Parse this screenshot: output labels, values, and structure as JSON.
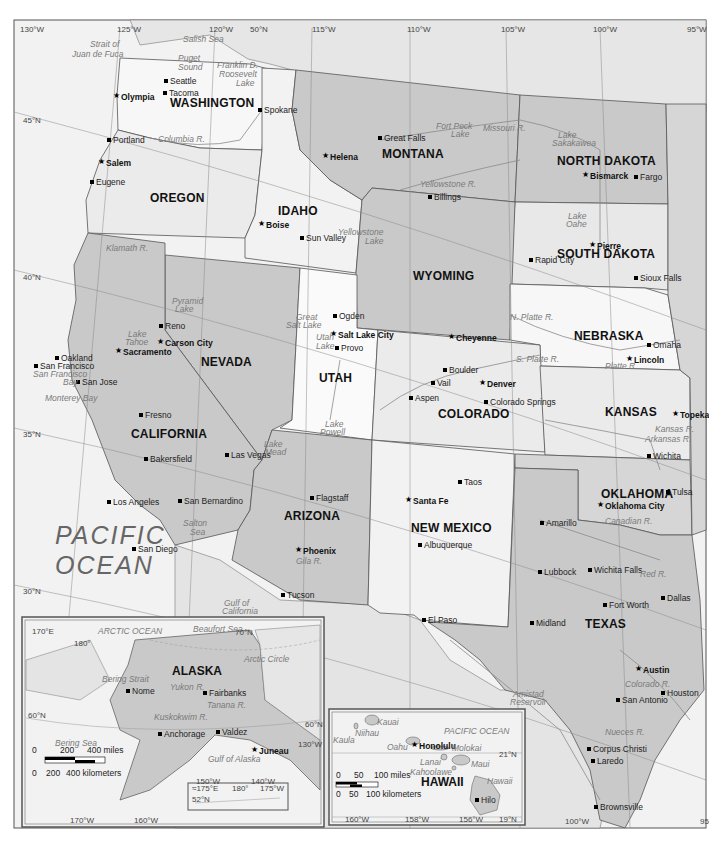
{
  "map": {
    "ocean_label_line1": "PACIFIC",
    "ocean_label_line2": "OCEAN",
    "states": [
      {
        "name": "WASHINGTON",
        "x": 170,
        "y": 97
      },
      {
        "name": "OREGON",
        "x": 150,
        "y": 192
      },
      {
        "name": "IDAHO",
        "x": 278,
        "y": 205
      },
      {
        "name": "MONTANA",
        "x": 382,
        "y": 148
      },
      {
        "name": "NORTH DAKOTA",
        "x": 557,
        "y": 155
      },
      {
        "name": "SOUTH DAKOTA",
        "x": 557,
        "y": 248
      },
      {
        "name": "WYOMING",
        "x": 413,
        "y": 270
      },
      {
        "name": "NEBRASKA",
        "x": 574,
        "y": 330
      },
      {
        "name": "NEVADA",
        "x": 201,
        "y": 356
      },
      {
        "name": "UTAH",
        "x": 319,
        "y": 372
      },
      {
        "name": "CALIFORNIA",
        "x": 131,
        "y": 428
      },
      {
        "name": "COLORADO",
        "x": 438,
        "y": 408
      },
      {
        "name": "KANSAS",
        "x": 605,
        "y": 406
      },
      {
        "name": "ARIZONA",
        "x": 284,
        "y": 510
      },
      {
        "name": "NEW MEXICO",
        "x": 411,
        "y": 522
      },
      {
        "name": "OKLAHOMA",
        "x": 601,
        "y": 488
      },
      {
        "name": "TEXAS",
        "x": 585,
        "y": 618
      }
    ],
    "cities": [
      {
        "name": "Seattle",
        "x": 170,
        "y": 77,
        "type": "city"
      },
      {
        "name": "Tacoma",
        "x": 169,
        "y": 89,
        "type": "city"
      },
      {
        "name": "Olympia",
        "x": 121,
        "y": 93,
        "type": "capital"
      },
      {
        "name": "Spokane",
        "x": 264,
        "y": 106,
        "type": "city"
      },
      {
        "name": "Portland",
        "x": 113,
        "y": 136,
        "type": "city"
      },
      {
        "name": "Salem",
        "x": 106,
        "y": 159,
        "type": "capital"
      },
      {
        "name": "Eugene",
        "x": 96,
        "y": 178,
        "type": "city"
      },
      {
        "name": "Helena",
        "x": 330,
        "y": 153,
        "type": "capital"
      },
      {
        "name": "Great Falls",
        "x": 384,
        "y": 134,
        "type": "city"
      },
      {
        "name": "Billings",
        "x": 434,
        "y": 193,
        "type": "city"
      },
      {
        "name": "Bismarck",
        "x": 590,
        "y": 172,
        "type": "capital"
      },
      {
        "name": "Fargo",
        "x": 640,
        "y": 173,
        "type": "city"
      },
      {
        "name": "Boise",
        "x": 266,
        "y": 221,
        "type": "capital"
      },
      {
        "name": "Sun Valley",
        "x": 306,
        "y": 234,
        "type": "city"
      },
      {
        "name": "Pierre",
        "x": 597,
        "y": 242,
        "type": "capital"
      },
      {
        "name": "Rapid City",
        "x": 535,
        "y": 256,
        "type": "city",
        "line2": "City"
      },
      {
        "name": "Sioux Falls",
        "x": 640,
        "y": 274,
        "type": "city"
      },
      {
        "name": "Ogden",
        "x": 339,
        "y": 312,
        "type": "city"
      },
      {
        "name": "Salt Lake City",
        "x": 338,
        "y": 331,
        "type": "capital"
      },
      {
        "name": "Provo",
        "x": 341,
        "y": 344,
        "type": "city"
      },
      {
        "name": "Reno",
        "x": 165,
        "y": 322,
        "type": "city"
      },
      {
        "name": "Carson City",
        "x": 165,
        "y": 339,
        "type": "capital"
      },
      {
        "name": "Sacramento",
        "x": 123,
        "y": 348,
        "type": "capital"
      },
      {
        "name": "Oakland",
        "x": 61,
        "y": 354,
        "type": "city"
      },
      {
        "name": "San Francisco",
        "x": 40,
        "y": 362,
        "type": "city"
      },
      {
        "name": "San Jose",
        "x": 82,
        "y": 378,
        "type": "city"
      },
      {
        "name": "Cheyenne",
        "x": 456,
        "y": 334,
        "type": "capital"
      },
      {
        "name": "Omaha",
        "x": 653,
        "y": 341,
        "type": "city"
      },
      {
        "name": "Lincoln",
        "x": 634,
        "y": 356,
        "type": "capital"
      },
      {
        "name": "Boulder",
        "x": 449,
        "y": 366,
        "type": "city"
      },
      {
        "name": "Denver",
        "x": 487,
        "y": 380,
        "type": "capital"
      },
      {
        "name": "Vail",
        "x": 437,
        "y": 379,
        "type": "city"
      },
      {
        "name": "Aspen",
        "x": 415,
        "y": 394,
        "type": "city"
      },
      {
        "name": "Colorado Springs",
        "x": 490,
        "y": 398,
        "type": "city"
      },
      {
        "name": "Fresno",
        "x": 145,
        "y": 411,
        "type": "city"
      },
      {
        "name": "Topeka",
        "x": 680,
        "y": 411,
        "type": "capital"
      },
      {
        "name": "Wichita",
        "x": 653,
        "y": 452,
        "type": "city"
      },
      {
        "name": "Las Vegas",
        "x": 231,
        "y": 451,
        "type": "city"
      },
      {
        "name": "Bakersfield",
        "x": 150,
        "y": 455,
        "type": "city"
      },
      {
        "name": "Taos",
        "x": 464,
        "y": 478,
        "type": "city"
      },
      {
        "name": "Santa Fe",
        "x": 413,
        "y": 497,
        "type": "capital"
      },
      {
        "name": "Tulsa",
        "x": 672,
        "y": 488,
        "type": "city"
      },
      {
        "name": "Oklahoma City",
        "x": 605,
        "y": 502,
        "type": "capital"
      },
      {
        "name": "Los Angeles",
        "x": 113,
        "y": 498,
        "type": "city"
      },
      {
        "name": "San Bernardino",
        "x": 184,
        "y": 497,
        "type": "city"
      },
      {
        "name": "Flagstaff",
        "x": 316,
        "y": 494,
        "type": "city"
      },
      {
        "name": "Amarillo",
        "x": 546,
        "y": 519,
        "type": "city"
      },
      {
        "name": "Phoenix",
        "x": 303,
        "y": 547,
        "type": "capital"
      },
      {
        "name": "Albuquerque",
        "x": 424,
        "y": 541,
        "type": "city"
      },
      {
        "name": "San Diego",
        "x": 138,
        "y": 545,
        "type": "city"
      },
      {
        "name": "Lubbock",
        "x": 544,
        "y": 568,
        "type": "city"
      },
      {
        "name": "Wichita Falls",
        "x": 594,
        "y": 566,
        "type": "city"
      },
      {
        "name": "Dallas",
        "x": 667,
        "y": 594,
        "type": "city"
      },
      {
        "name": "Fort Worth",
        "x": 609,
        "y": 601,
        "type": "city"
      },
      {
        "name": "Tucson",
        "x": 287,
        "y": 591,
        "type": "city"
      },
      {
        "name": "El Paso",
        "x": 428,
        "y": 616,
        "type": "city"
      },
      {
        "name": "Midland",
        "x": 536,
        "y": 619,
        "type": "city"
      },
      {
        "name": "Austin",
        "x": 643,
        "y": 666,
        "type": "capital"
      },
      {
        "name": "Houston",
        "x": 667,
        "y": 689,
        "type": "city"
      },
      {
        "name": "San Antonio",
        "x": 622,
        "y": 696,
        "type": "city"
      },
      {
        "name": "Corpus Christi",
        "x": 593,
        "y": 745,
        "type": "city"
      },
      {
        "name": "Laredo",
        "x": 597,
        "y": 757,
        "type": "city"
      },
      {
        "name": "Brownsville",
        "x": 600,
        "y": 803,
        "type": "city"
      }
    ],
    "water_features": [
      {
        "name": "Salish Sea",
        "x": 183,
        "y": 35
      },
      {
        "name": "Strait of",
        "x": 90,
        "y": 40
      },
      {
        "name": "Juan de Fuca",
        "x": 72,
        "y": 50
      },
      {
        "name": "Puget",
        "x": 178,
        "y": 54
      },
      {
        "name": "Sound",
        "x": 178,
        "y": 63
      },
      {
        "name": "Franklin D.",
        "x": 217,
        "y": 61
      },
      {
        "name": "Roosevelt",
        "x": 219,
        "y": 70
      },
      {
        "name": "Lake",
        "x": 236,
        "y": 79
      },
      {
        "name": "Columbia R.",
        "x": 158,
        "y": 135
      },
      {
        "name": "Fort Peck",
        "x": 436,
        "y": 122
      },
      {
        "name": "Lake",
        "x": 451,
        "y": 130
      },
      {
        "name": "Missouri R.",
        "x": 483,
        "y": 124
      },
      {
        "name": "Lake",
        "x": 558,
        "y": 131
      },
      {
        "name": "Sakakawea",
        "x": 552,
        "y": 139
      },
      {
        "name": "Yellowstone R.",
        "x": 420,
        "y": 180
      },
      {
        "name": "Klamath R.",
        "x": 106,
        "y": 244
      },
      {
        "name": "Yellowstone",
        "x": 338,
        "y": 228
      },
      {
        "name": "Lake",
        "x": 365,
        "y": 237
      },
      {
        "name": "Lake",
        "x": 568,
        "y": 212
      },
      {
        "name": "Oahe",
        "x": 566,
        "y": 220
      },
      {
        "name": "Pyramid",
        "x": 172,
        "y": 297
      },
      {
        "name": "Lake",
        "x": 175,
        "y": 305
      },
      {
        "name": "Great",
        "x": 296,
        "y": 313
      },
      {
        "name": "Salt Lake",
        "x": 286,
        "y": 321
      },
      {
        "name": "Utah",
        "x": 316,
        "y": 333
      },
      {
        "name": "Lake",
        "x": 316,
        "y": 342
      },
      {
        "name": "N. Platte R.",
        "x": 510,
        "y": 313
      },
      {
        "name": "Lake",
        "x": 128,
        "y": 330
      },
      {
        "name": "Tahoe",
        "x": 125,
        "y": 338
      },
      {
        "name": "S. Platte R.",
        "x": 516,
        "y": 355
      },
      {
        "name": "Platte R.",
        "x": 605,
        "y": 362
      },
      {
        "name": "San Francisco",
        "x": 33,
        "y": 370
      },
      {
        "name": "Bay",
        "x": 63,
        "y": 378
      },
      {
        "name": "Monterey Bay",
        "x": 45,
        "y": 394
      },
      {
        "name": "Kansas R.",
        "x": 655,
        "y": 425
      },
      {
        "name": "Arkansas R.",
        "x": 645,
        "y": 435
      },
      {
        "name": "Lake",
        "x": 325,
        "y": 420
      },
      {
        "name": "Powell",
        "x": 320,
        "y": 428
      },
      {
        "name": "Lake",
        "x": 264,
        "y": 440
      },
      {
        "name": "Mead",
        "x": 265,
        "y": 448
      },
      {
        "name": "Canadian R.",
        "x": 605,
        "y": 517
      },
      {
        "name": "Salton",
        "x": 183,
        "y": 519
      },
      {
        "name": "Sea",
        "x": 190,
        "y": 528
      },
      {
        "name": "Gila R.",
        "x": 296,
        "y": 557
      },
      {
        "name": "Red R.",
        "x": 640,
        "y": 570
      },
      {
        "name": "Gulf of",
        "x": 224,
        "y": 599
      },
      {
        "name": "California",
        "x": 222,
        "y": 607
      },
      {
        "name": "Amistad",
        "x": 513,
        "y": 690
      },
      {
        "name": "Reservoir",
        "x": 510,
        "y": 698
      },
      {
        "name": "Colorado R.",
        "x": 625,
        "y": 680
      },
      {
        "name": "Nueces R.",
        "x": 605,
        "y": 728
      }
    ],
    "grid_labels": [
      {
        "text": "130°W",
        "x": 20,
        "y": 26
      },
      {
        "text": "125°W",
        "x": 117,
        "y": 26
      },
      {
        "text": "120°W",
        "x": 209,
        "y": 26
      },
      {
        "text": "50°N",
        "x": 250,
        "y": 26
      },
      {
        "text": "115°W",
        "x": 312,
        "y": 26
      },
      {
        "text": "110°W",
        "x": 407,
        "y": 26
      },
      {
        "text": "105°W",
        "x": 501,
        "y": 26
      },
      {
        "text": "100°W",
        "x": 593,
        "y": 26
      },
      {
        "text": "95°W",
        "x": 687,
        "y": 26
      },
      {
        "text": "45°N",
        "x": 23,
        "y": 117
      },
      {
        "text": "40°N",
        "x": 23,
        "y": 274
      },
      {
        "text": "35°N",
        "x": 23,
        "y": 431
      },
      {
        "text": "30°N",
        "x": 23,
        "y": 588
      },
      {
        "text": "100°W",
        "x": 565,
        "y": 818
      },
      {
        "text": "95",
        "x": 700,
        "y": 818
      }
    ]
  },
  "alaska_inset": {
    "title": "ALASKA",
    "cities": [
      {
        "name": "Nome",
        "x": 132,
        "y": 687,
        "type": "city"
      },
      {
        "name": "Fairbanks",
        "x": 209,
        "y": 689,
        "type": "city"
      },
      {
        "name": "Anchorage",
        "x": 164,
        "y": 730,
        "type": "city"
      },
      {
        "name": "Valdez",
        "x": 222,
        "y": 728,
        "type": "city"
      },
      {
        "name": "Juneau",
        "x": 259,
        "y": 747,
        "type": "capital"
      }
    ],
    "water_features": [
      {
        "name": "ARCTIC OCEAN",
        "x": 98,
        "y": 627
      },
      {
        "name": "Beaufort Sea",
        "x": 193,
        "y": 625
      },
      {
        "name": "Arctic Circle",
        "x": 244,
        "y": 655
      },
      {
        "name": "Bering Strait",
        "x": 102,
        "y": 675
      },
      {
        "name": "Yukon R.",
        "x": 170,
        "y": 683
      },
      {
        "name": "Tanana R.",
        "x": 207,
        "y": 701
      },
      {
        "name": "Kuskokwim R.",
        "x": 154,
        "y": 713
      },
      {
        "name": "Bering Sea",
        "x": 55,
        "y": 739
      },
      {
        "name": "Gulf of Alaska",
        "x": 208,
        "y": 755
      }
    ],
    "grid_labels": [
      {
        "text": "170°E",
        "x": 32,
        "y": 628
      },
      {
        "text": "180°",
        "x": 74,
        "y": 640
      },
      {
        "text": "70°N",
        "x": 235,
        "y": 629
      },
      {
        "text": "60°N",
        "x": 28,
        "y": 712
      },
      {
        "text": "60°N",
        "x": 305,
        "y": 721
      },
      {
        "text": "130°W",
        "x": 298,
        "y": 741
      },
      {
        "text": "150°W",
        "x": 196,
        "y": 778
      },
      {
        "text": "140°W",
        "x": 251,
        "y": 778
      },
      {
        "text": "170°W",
        "x": 70,
        "y": 817
      },
      {
        "text": "160°W",
        "x": 134,
        "y": 817
      }
    ],
    "scale": {
      "miles_labels": [
        "0",
        "200",
        "400 miles"
      ],
      "km_labels": [
        "0",
        "200",
        "400 kilometers"
      ]
    },
    "aleutian_inset": {
      "labels": [
        "≈175°E",
        "180°",
        "175°W",
        "52°N"
      ]
    }
  },
  "hawaii_inset": {
    "title": "HAWAII",
    "ocean_label": "PACIFIC OCEAN",
    "cities": [
      {
        "name": "Honolulu",
        "x": 419,
        "y": 742,
        "type": "capital"
      },
      {
        "name": "Hilo",
        "x": 481,
        "y": 796,
        "type": "city"
      }
    ],
    "islands": [
      {
        "name": "Kauai",
        "x": 377,
        "y": 718
      },
      {
        "name": "Niihau",
        "x": 355,
        "y": 729
      },
      {
        "name": "Kaula",
        "x": 333,
        "y": 736
      },
      {
        "name": "Oahu",
        "x": 387,
        "y": 743
      },
      {
        "name": "Molokai",
        "x": 452,
        "y": 744
      },
      {
        "name": "Lanai",
        "x": 420,
        "y": 758
      },
      {
        "name": "Maui",
        "x": 471,
        "y": 760
      },
      {
        "name": "Kahoolawe",
        "x": 410,
        "y": 768
      },
      {
        "name": "Hawaii",
        "x": 487,
        "y": 777
      }
    ],
    "grid_labels": [
      {
        "text": "21°N",
        "x": 499,
        "y": 751
      },
      {
        "text": "19°N",
        "x": 499,
        "y": 816
      },
      {
        "text": "160°W",
        "x": 345,
        "y": 816
      },
      {
        "text": "158°W",
        "x": 405,
        "y": 816
      },
      {
        "text": "156°W",
        "x": 459,
        "y": 816
      }
    ],
    "scale": {
      "miles_labels": [
        "0",
        "50",
        "100 miles"
      ],
      "km_labels": [
        "0",
        "50",
        "100 kilometers"
      ]
    }
  }
}
